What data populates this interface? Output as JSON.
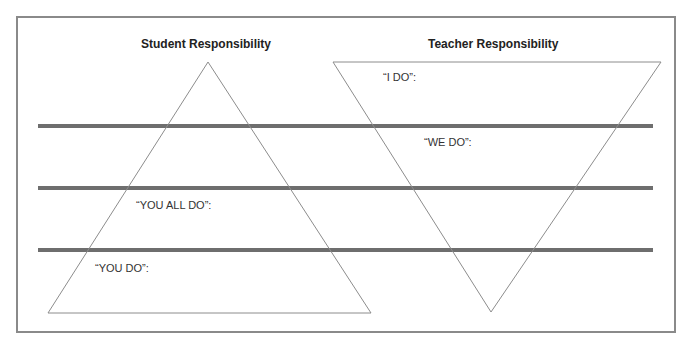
{
  "diagram": {
    "titles": {
      "student": "Student Responsibility",
      "teacher": "Teacher Responsibility"
    },
    "stages": [
      {
        "label": "“I DO”:"
      },
      {
        "label": "“WE DO”:"
      },
      {
        "label": "“YOU ALL DO”:"
      },
      {
        "label": "“YOU DO”:"
      }
    ],
    "colors": {
      "frame": "#8a8a8a",
      "divider": "#6e6e6e",
      "triangle": "#8c8c8c"
    }
  }
}
